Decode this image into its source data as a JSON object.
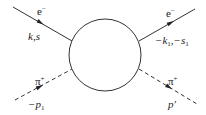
{
  "diagram": {
    "type": "feynman-scattering",
    "blob": {
      "cx": 105,
      "cy": 55,
      "r": 36,
      "label": ""
    },
    "lines": [
      {
        "id": "incoming-electron",
        "style": "solid",
        "particle": "e",
        "charge": "−",
        "momentum": "k,s",
        "x1": 13,
        "y1": 7,
        "x2": 72,
        "y2": 41
      },
      {
        "id": "outgoing-electron",
        "style": "solid",
        "particle": "e",
        "charge": "−",
        "momentum_main": "−k",
        "momentum_sub1": "1",
        "momentum_mid": ",−s",
        "momentum_sub2": "1",
        "x1": 139,
        "y1": 41,
        "x2": 195,
        "y2": 9
      },
      {
        "id": "incoming-pion",
        "style": "dashed",
        "particle": "π",
        "charge": "+",
        "momentum_main": "−p",
        "momentum_sub": "1",
        "x1": 15,
        "y1": 100,
        "x2": 72,
        "y2": 69
      },
      {
        "id": "outgoing-pion",
        "style": "dashed",
        "particle": "π",
        "charge": "+",
        "momentum": "p′",
        "x1": 139,
        "y1": 69,
        "x2": 197,
        "y2": 104
      }
    ]
  },
  "labels": {
    "e_in": {
      "base": "e",
      "sup": "−"
    },
    "k_s": "k,s",
    "e_out": {
      "base": "e",
      "sup": "−"
    },
    "k1_s1": {
      "a": "−k",
      "a_sub": "1",
      "b": ",−s",
      "b_sub": "1"
    },
    "pi_in": {
      "base": "π",
      "sup": "+"
    },
    "p1": {
      "a": "−p",
      "a_sub": "1"
    },
    "pi_out": {
      "base": "π",
      "sup": "+"
    },
    "p_prime": "p′"
  },
  "colors": {
    "stroke": "#333333",
    "background": "#ffffff"
  }
}
